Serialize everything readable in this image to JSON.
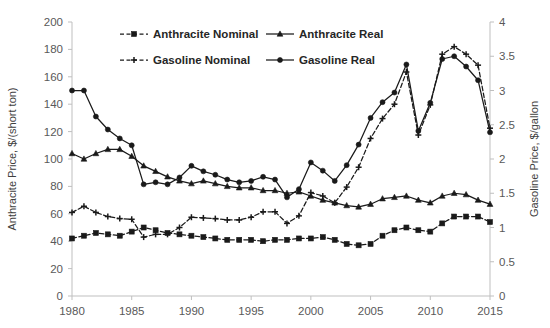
{
  "chart_data": {
    "type": "line",
    "title": "",
    "xlabel": "",
    "ylabel": "Anthracite Price, $/(short ton)",
    "y2label": "Gasoline Price, $/gallon",
    "grid": false,
    "legend_position": "top-inside",
    "xlim": [
      1980,
      2015
    ],
    "ylim": [
      0,
      200
    ],
    "y2lim": [
      0,
      4
    ],
    "xticks": [
      "1980",
      "1985",
      "1990",
      "1995",
      "2000",
      "2005",
      "2010",
      "2015"
    ],
    "xtick_values": [
      1980,
      1985,
      1990,
      1995,
      2000,
      2005,
      2010,
      2015
    ],
    "yticks": [
      "0",
      "20",
      "40",
      "60",
      "80",
      "100",
      "120",
      "140",
      "160",
      "180",
      "200"
    ],
    "ytick_values": [
      0,
      20,
      40,
      60,
      80,
      100,
      120,
      140,
      160,
      180,
      200
    ],
    "y2ticks": [
      "0",
      "0.5",
      "1",
      "1.5",
      "2",
      "2.5",
      "3",
      "3.5",
      "4"
    ],
    "y2tick_values": [
      0,
      0.5,
      1,
      1.5,
      2,
      2.5,
      3,
      3.5,
      4
    ],
    "x": [
      1980,
      1981,
      1982,
      1983,
      1984,
      1985,
      1986,
      1987,
      1988,
      1989,
      1990,
      1991,
      1992,
      1993,
      1994,
      1995,
      1996,
      1997,
      1998,
      1999,
      2000,
      2001,
      2002,
      2003,
      2004,
      2005,
      2006,
      2007,
      2008,
      2009,
      2010,
      2011,
      2012,
      2013,
      2014,
      2015
    ],
    "series": [
      {
        "name": "Anthracite Nominal",
        "axis": "left",
        "style": "dashed",
        "marker": "square",
        "values": [
          42,
          44,
          46,
          45,
          44,
          47,
          50,
          48,
          46,
          45,
          44,
          43,
          42,
          41,
          41,
          41,
          40,
          41,
          41,
          42,
          42,
          43,
          41,
          38,
          37,
          38,
          44,
          48,
          50,
          48,
          47,
          53,
          58,
          58,
          58,
          54
        ]
      },
      {
        "name": "Anthracite Real",
        "axis": "left",
        "style": "solid",
        "marker": "triangle",
        "values": [
          104,
          100,
          104,
          107,
          107,
          102,
          95,
          91,
          87,
          84,
          82,
          84,
          82,
          80,
          79,
          79,
          77,
          77,
          75,
          76,
          73,
          70,
          68,
          66,
          65,
          67,
          71,
          72,
          73,
          70,
          68,
          73,
          75,
          74,
          70,
          67
        ]
      },
      {
        "name": "Gasoline Nominal",
        "axis": "right",
        "style": "dashed",
        "marker": "plus",
        "values": [
          1.22,
          1.31,
          1.22,
          1.16,
          1.13,
          1.12,
          0.86,
          0.9,
          0.9,
          1.0,
          1.15,
          1.14,
          1.13,
          1.11,
          1.11,
          1.15,
          1.23,
          1.23,
          1.06,
          1.17,
          1.51,
          1.46,
          1.36,
          1.59,
          1.88,
          2.3,
          2.59,
          2.8,
          3.27,
          2.35,
          2.79,
          3.53,
          3.64,
          3.53,
          3.37,
          2.45
        ]
      },
      {
        "name": "Gasoline Real",
        "axis": "right",
        "style": "solid",
        "marker": "circle",
        "values": [
          3.0,
          3.0,
          2.62,
          2.43,
          2.3,
          2.2,
          1.63,
          1.66,
          1.63,
          1.73,
          1.9,
          1.82,
          1.77,
          1.7,
          1.66,
          1.68,
          1.74,
          1.7,
          1.44,
          1.56,
          1.95,
          1.83,
          1.68,
          1.91,
          2.21,
          2.6,
          2.83,
          2.97,
          3.38,
          2.41,
          2.82,
          3.46,
          3.5,
          3.35,
          3.15,
          2.39
        ]
      }
    ],
    "legend": [
      {
        "label": "Anthracite Nominal",
        "style": "dashed",
        "marker": "square"
      },
      {
        "label": "Anthracite Real",
        "style": "solid",
        "marker": "triangle"
      },
      {
        "label": "Gasoline Nominal",
        "style": "dashed",
        "marker": "plus"
      },
      {
        "label": "Gasoline Real",
        "style": "solid",
        "marker": "circle"
      }
    ],
    "colors": {
      "series": "#1a1a1a",
      "axis": "#bfbfbf",
      "text": "#3f3f3f",
      "background": "#ffffff"
    }
  }
}
